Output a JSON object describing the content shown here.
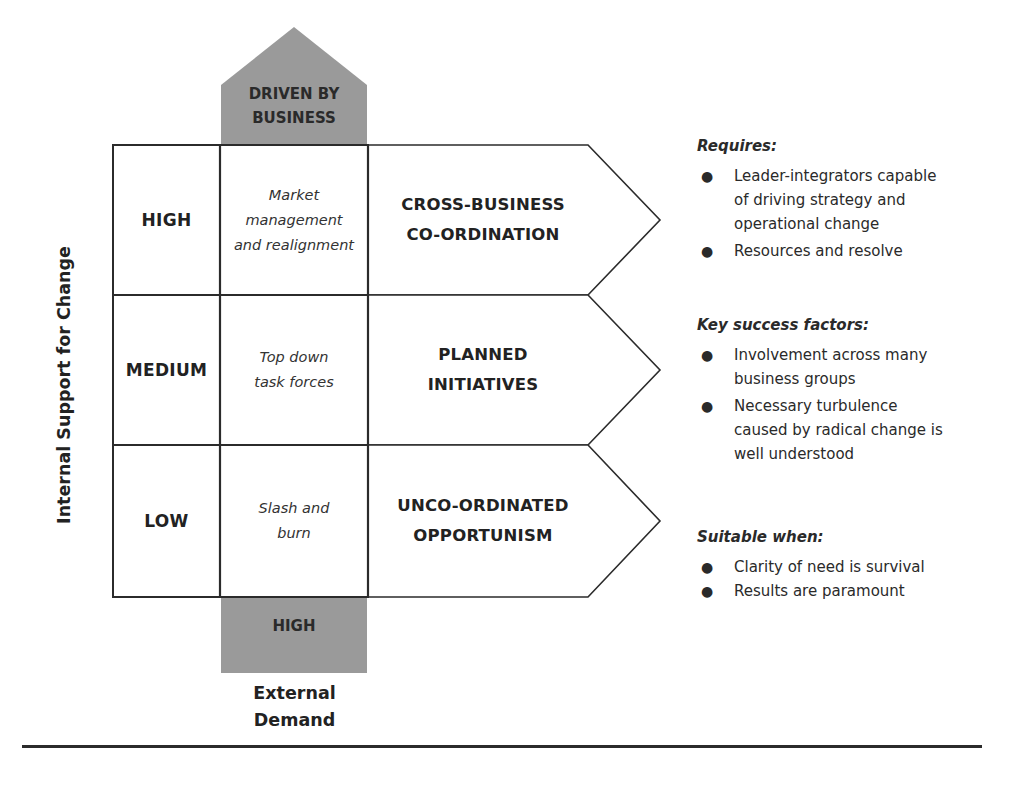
{
  "diagram": {
    "top_arrow_label": "DRIVEN BY BUSINESS",
    "top_arrow_lines": [
      "DRIVEN BY",
      "BUSINESS"
    ],
    "bottom_box_label": "HIGH",
    "y_axis_label": "Internal Support for Change",
    "x_axis_label_lines": [
      "External",
      "Demand"
    ],
    "colors": {
      "gray_fill": "#9a9a9a",
      "stroke": "#2b2b2b",
      "background": "#ffffff"
    },
    "rows": [
      {
        "level": "HIGH",
        "approach_lines": [
          "Market",
          "management",
          "and realignment"
        ],
        "mode_lines": [
          "CROSS-BUSINESS",
          "CO-ORDINATION"
        ]
      },
      {
        "level": "MEDIUM",
        "approach_lines": [
          "Top down",
          "task forces"
        ],
        "mode_lines": [
          "PLANNED",
          "INITIATIVES"
        ]
      },
      {
        "level": "LOW",
        "approach_lines": [
          "Slash and",
          "burn"
        ],
        "mode_lines": [
          "UNCO-ORDINATED",
          "OPPORTUNISM"
        ]
      }
    ]
  },
  "sidebar": {
    "sections": [
      {
        "heading": "Requires:",
        "items": [
          {
            "lines": [
              "Leader-integrators capable",
              "of driving strategy and",
              "operational change"
            ]
          },
          {
            "lines": [
              "Resources and resolve"
            ]
          }
        ]
      },
      {
        "heading": "Key success factors:",
        "items": [
          {
            "lines": [
              "Involvement across many",
              "business groups"
            ]
          },
          {
            "lines": [
              "Necessary turbulence",
              "caused by radical change is",
              "well understood"
            ]
          }
        ]
      },
      {
        "heading": "Suitable when:",
        "items": [
          {
            "lines": [
              "Clarity of need is survival"
            ]
          },
          {
            "lines": [
              "Results are paramount"
            ]
          }
        ]
      }
    ],
    "bullet_glyph": "●"
  }
}
